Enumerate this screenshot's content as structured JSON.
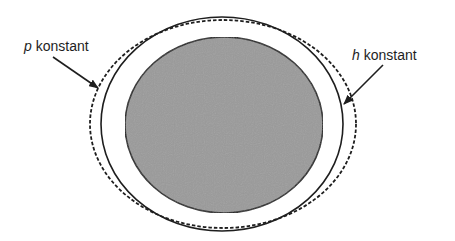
{
  "diagram": {
    "labels": {
      "p": {
        "variable": "p",
        "text": " konstant"
      },
      "h": {
        "variable": "h",
        "text": " konstant"
      }
    },
    "colors": {
      "fill_core": "#9a9a9a",
      "stroke": "#1e1e1e",
      "background": "#ffffff"
    },
    "shapes": {
      "core_ellipse": {
        "cx": 224,
        "cy": 125,
        "rx": 99,
        "ry": 88,
        "style": "filled-gray"
      },
      "solid_ellipse": {
        "cx": 222,
        "cy": 124,
        "rx": 121,
        "ry": 107,
        "style": "solid"
      },
      "dashed_ellipse": {
        "cx": 223,
        "cy": 124,
        "rx": 133,
        "ry": 104,
        "style": "dashed"
      }
    },
    "arrows": {
      "p_arrow": {
        "from": [
          53,
          57
        ],
        "to": [
          98,
          88
        ],
        "target": "dashed_ellipse"
      },
      "h_arrow": {
        "from": [
          383,
          65
        ],
        "to": [
          344,
          104
        ],
        "target": "solid_ellipse"
      }
    }
  }
}
